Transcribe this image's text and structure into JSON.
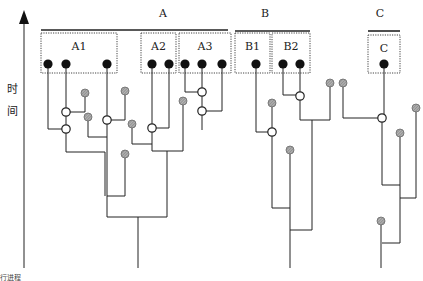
{
  "axis": {
    "label_chars": [
      "时",
      "间"
    ],
    "label_meaning": "time",
    "arrow": {
      "x": 24,
      "y_top": 12,
      "y_bottom": 268
    },
    "footer_text": "行进程"
  },
  "groups": [
    {
      "id": "A",
      "label": "A",
      "label_pos": [
        163,
        17
      ],
      "bar": [
        41,
        228,
        30
      ]
    },
    {
      "id": "B",
      "label": "B",
      "label_pos": [
        265,
        17
      ],
      "bar": [
        235,
        310,
        31
      ]
    },
    {
      "id": "C",
      "label": "C",
      "label_pos": [
        380,
        17
      ],
      "bar": [
        368,
        400,
        31
      ]
    }
  ],
  "subgroups": [
    {
      "id": "A1",
      "label": "A1",
      "box": [
        41,
        33,
        76,
        40
      ],
      "samples": [
        48,
        66,
        107
      ]
    },
    {
      "id": "A2",
      "label": "A2",
      "box": [
        141,
        33,
        35,
        40
      ],
      "samples": [
        152,
        169
      ]
    },
    {
      "id": "A3",
      "label": "A3",
      "box": [
        179,
        33,
        52,
        40
      ],
      "samples": [
        185,
        202,
        222
      ]
    },
    {
      "id": "B1",
      "label": "B1",
      "box": [
        235,
        33,
        35,
        40
      ],
      "samples": [
        256
      ]
    },
    {
      "id": "B2",
      "label": "B2",
      "box": [
        272,
        33,
        38,
        40
      ],
      "samples": [
        283,
        300
      ]
    },
    {
      "id": "C",
      "label": "C",
      "box": [
        368,
        35,
        32,
        38
      ],
      "samples": [
        384
      ]
    }
  ],
  "legend_semantics": {
    "black_dot": "sampled lineage",
    "open_circle": "coalescent node",
    "grey_dot": "unsampled/extinct lineage"
  },
  "tree_edges": [
    "M48 64 V129 H66",
    "M66 64 V152 H105 V196",
    "M85 93 V112 H66",
    "M88 117 V137 H107",
    "M107 64 V217 H167",
    "M125 91 V120 H107",
    "M125 154 V196 H107",
    "M152 64 V151 H183",
    "M169 64 V128 H152",
    "M132 124 V144 H152",
    "M185 64 V92 H202",
    "M202 64 V130",
    "M222 64 V111 H202",
    "M183 101 V151",
    "M167 151 V217",
    "M138 217 V268",
    "M256 64 V132 H272",
    "M272 103 V208 H290",
    "M290 150 V268",
    "M283 64 V95 H300",
    "M300 64 V120 H330",
    "M330 83 V120",
    "M312 120 V230 H290",
    "M343 83 V118 H382",
    "M384 64 V118",
    "M382 118 V185 H400",
    "M400 133 V243 H382",
    "M416 108 V198 H400",
    "M381 221 V268"
  ],
  "coalescent_nodes": [
    [
      66,
      112
    ],
    [
      66,
      129
    ],
    [
      107,
      120
    ],
    [
      152,
      128
    ],
    [
      202,
      92
    ],
    [
      202,
      111
    ],
    [
      300,
      96
    ],
    [
      272,
      132
    ],
    [
      382,
      118
    ]
  ],
  "unsampled_lineages": [
    [
      85,
      93
    ],
    [
      88,
      117
    ],
    [
      125,
      91
    ],
    [
      132,
      124
    ],
    [
      125,
      154
    ],
    [
      183,
      101
    ],
    [
      272,
      103
    ],
    [
      330,
      83
    ],
    [
      290,
      150
    ],
    [
      343,
      83
    ],
    [
      416,
      108
    ],
    [
      400,
      133
    ],
    [
      381,
      221
    ]
  ]
}
